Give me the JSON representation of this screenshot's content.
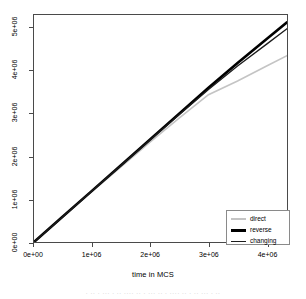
{
  "chart_data": {
    "type": "line",
    "title": "",
    "xlabel": "time in MCS",
    "ylabel": "",
    "xlim": [
      0,
      4350000
    ],
    "ylim": [
      0,
      5300000
    ],
    "grid": false,
    "legend_position": "bottom-right",
    "xticks": [
      {
        "value": 0,
        "label": "0e+00"
      },
      {
        "value": 1000000,
        "label": "1e+06"
      },
      {
        "value": 2000000,
        "label": "2e+06"
      },
      {
        "value": 3000000,
        "label": "3e+06"
      },
      {
        "value": 4000000,
        "label": "4e+06"
      }
    ],
    "yticks": [
      {
        "value": 0,
        "label": "0e+00"
      },
      {
        "value": 1000000,
        "label": "1e+06"
      },
      {
        "value": 2000000,
        "label": "2e+06"
      },
      {
        "value": 3000000,
        "label": "3e+06"
      },
      {
        "value": 4000000,
        "label": "4e+06"
      },
      {
        "value": 5000000,
        "label": "5e+06"
      }
    ],
    "x": [
      0,
      500000,
      1000000,
      1500000,
      2000000,
      2500000,
      3000000,
      3500000,
      4000000,
      4350000
    ],
    "series": [
      {
        "name": "direct",
        "color": "#c4c4c4",
        "width": 1.6,
        "values": [
          0,
          590000,
          1180000,
          1760000,
          2340000,
          2900000,
          3440000,
          3760000,
          4110000,
          4350000
        ]
      },
      {
        "name": "reverse",
        "color": "#000000",
        "width": 2.6,
        "values": [
          0,
          600000,
          1200000,
          1800000,
          2400000,
          3000000,
          3600000,
          4180000,
          4740000,
          5130000
        ]
      },
      {
        "name": "changing",
        "color": "#1c1c1c",
        "width": 1.3,
        "values": [
          0,
          597000,
          1194000,
          1790000,
          2385000,
          2975000,
          3560000,
          4110000,
          4620000,
          4980000
        ]
      }
    ]
  },
  "legend": {
    "entries": [
      {
        "label": "direct"
      },
      {
        "label": "reverse"
      },
      {
        "label": "changing"
      }
    ]
  },
  "scan": {
    "bottom_remnant": "· ·· · ··· · ·· ···· ·· · ··· ·· · ···· ·· · ·· ··· · ··"
  }
}
